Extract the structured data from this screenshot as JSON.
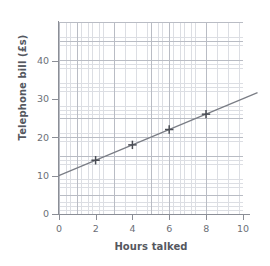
{
  "chart_data": {
    "type": "scatter",
    "title": "",
    "xlabel": "Hours talked",
    "ylabel": "Telephone bill (£s)",
    "xlim": [
      0,
      10
    ],
    "ylim": [
      0,
      50
    ],
    "xticks": [
      0,
      2,
      4,
      6,
      8,
      10
    ],
    "yticks": [
      0,
      10,
      20,
      30,
      40
    ],
    "xtick_labels": [
      "0",
      "2",
      "4",
      "6",
      "8",
      "10"
    ],
    "ytick_labels": [
      "0",
      "10",
      "20",
      "30",
      "40"
    ],
    "grid": true,
    "grid_minor": true,
    "legend": "none",
    "x": [
      2,
      4,
      6,
      8
    ],
    "values": [
      14,
      18,
      22,
      26
    ],
    "points": [
      {
        "x": 2,
        "y": 14,
        "marker": "plus"
      },
      {
        "x": 4,
        "y": 18,
        "marker": "plus"
      },
      {
        "x": 6,
        "y": 22,
        "marker": "plus"
      },
      {
        "x": 8,
        "y": 26,
        "marker": "plus"
      }
    ],
    "series": [
      {
        "name": "line of best fit",
        "type": "line",
        "intercept": 10,
        "slope": 2,
        "x_start": 0,
        "y_start": 10,
        "x_end": 10.8,
        "y_end": 31.6
      }
    ],
    "colors": {
      "line": "#7a7d85",
      "marker": "#4a4d55",
      "axis": "#8b8e96",
      "grid_major": "#b9bcc4",
      "grid_minor": "#dcdee3",
      "text": "#6c6f77",
      "title_text": "#55585f",
      "background": "#ffffff"
    }
  },
  "axes": {
    "y_title": "Telephone bill (£s)",
    "x_title": "Hours talked",
    "y_labels": [
      "40",
      "30",
      "20",
      "10",
      "0"
    ],
    "x_labels": [
      "0",
      "2",
      "4",
      "6",
      "8",
      "10"
    ]
  }
}
